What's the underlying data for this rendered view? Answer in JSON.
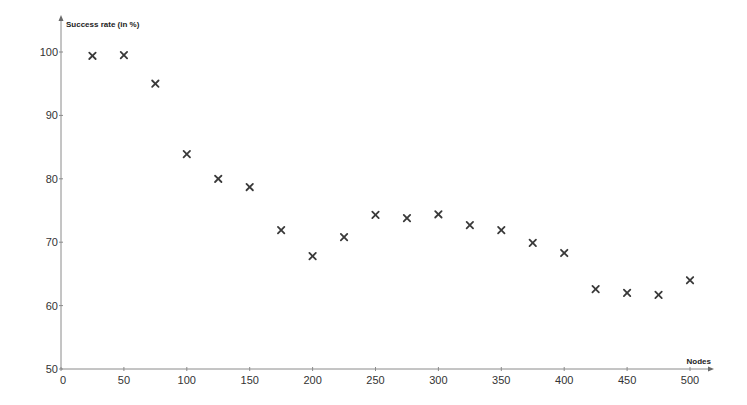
{
  "chart_data": {
    "type": "scatter",
    "title": "",
    "xlabel": "Nodes",
    "ylabel": "Success rate (in %)",
    "xlim": [
      0,
      500
    ],
    "ylim": [
      50,
      100
    ],
    "x_ticks": [
      0,
      50,
      100,
      150,
      200,
      250,
      300,
      350,
      400,
      450,
      500
    ],
    "y_ticks": [
      50,
      60,
      70,
      80,
      90,
      100
    ],
    "x_tick_labels": [
      "0",
      "50",
      "100",
      "150",
      "200",
      "250",
      "300",
      "350",
      "400",
      "450",
      "500"
    ],
    "y_tick_labels": [
      "50",
      "60",
      "70",
      "80",
      "90",
      "100"
    ],
    "grid": false,
    "legend": null,
    "marker": "x",
    "marker_color": "#3a3a3a",
    "axis_color": "#8a8a8a",
    "series": [
      {
        "name": "Success rate",
        "x": [
          25,
          50,
          75,
          100,
          125,
          150,
          175,
          200,
          225,
          250,
          275,
          300,
          325,
          350,
          375,
          400,
          425,
          450,
          475,
          500
        ],
        "y": [
          99.4,
          99.5,
          95.0,
          83.9,
          80.0,
          78.7,
          71.9,
          67.8,
          70.8,
          74.3,
          73.8,
          74.4,
          72.7,
          71.9,
          69.9,
          68.3,
          62.6,
          62.0,
          61.7,
          64.0
        ]
      }
    ]
  }
}
